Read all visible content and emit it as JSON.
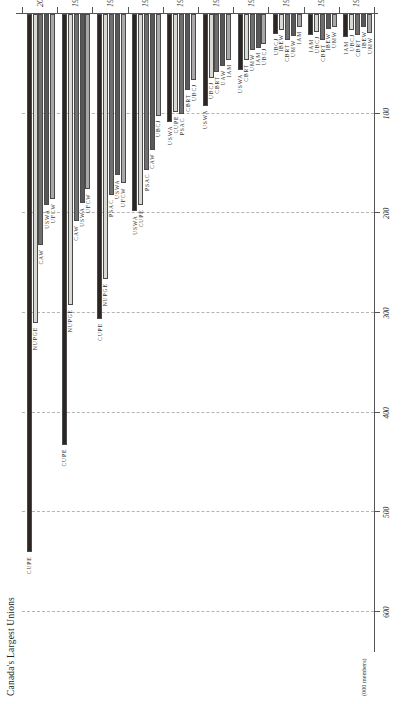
{
  "figure": {
    "title": "Canada's Largest Unions",
    "axis_unit": "(000 members)"
  },
  "chart_data": {
    "type": "bar",
    "orientation": "horizontal",
    "title": "Canada's Largest Unions",
    "xlabel": "(000 members)",
    "ylabel": "",
    "xlim": [
      0,
      640
    ],
    "grid": true,
    "legend": "none",
    "value_ticks": [
      "600",
      "500",
      "400",
      "300",
      "200",
      "100"
    ],
    "value_tick_values": [
      600,
      500,
      400,
      300,
      200,
      100
    ],
    "categories": [
      "1917",
      "1927",
      "1937",
      "1947",
      "1957",
      "1967",
      "1977",
      "1987",
      "1997",
      "2007"
    ],
    "groups": [
      {
        "year": "2007",
        "bars": [
          {
            "label": "CUPE",
            "value": 540,
            "color": "#2b2523"
          },
          {
            "label": "NUPGE",
            "value": 310,
            "color": "#d9d9d4"
          },
          {
            "label": "CAW",
            "value": 232,
            "color": "#6f6f6f"
          },
          {
            "label": "USWA",
            "value": 192,
            "color": "#585858"
          },
          {
            "label": "UFCW",
            "value": 186,
            "color": "#a8a8a8"
          }
        ]
      },
      {
        "year": "1997",
        "bars": [
          {
            "label": "CUPE",
            "value": 432,
            "color": "#2b2523"
          },
          {
            "label": "NUPGE",
            "value": 292,
            "color": "#d9d9d4"
          },
          {
            "label": "CAW",
            "value": 208,
            "color": "#6f6f6f"
          },
          {
            "label": "USWA",
            "value": 190,
            "color": "#585858"
          },
          {
            "label": "UFCW",
            "value": 176,
            "color": "#a8a8a8"
          }
        ]
      },
      {
        "year": "1987",
        "bars": [
          {
            "label": "CUPE",
            "value": 306,
            "color": "#2b2523"
          },
          {
            "label": "NUPGE",
            "value": 266,
            "color": "#d9d9d4"
          },
          {
            "label": "PSAC",
            "value": 182,
            "color": "#6f6f6f"
          },
          {
            "label": "USWA",
            "value": 162,
            "color": "#585858"
          },
          {
            "label": "UFCW",
            "value": 170,
            "color": "#a8a8a8"
          }
        ]
      },
      {
        "year": "1977",
        "bars": [
          {
            "label": "USWA",
            "value": 198,
            "color": "#2b2523"
          },
          {
            "label": "CUPE",
            "value": 192,
            "color": "#d9d9d4"
          },
          {
            "label": "PSAC",
            "value": 156,
            "color": "#6f6f6f"
          },
          {
            "label": "CAW",
            "value": 136,
            "color": "#585858"
          },
          {
            "label": "UBCJ",
            "value": 102,
            "color": "#a8a8a8"
          }
        ]
      },
      {
        "year": "1967",
        "bars": [
          {
            "label": "USWA",
            "value": 108,
            "color": "#2b2523"
          },
          {
            "label": "CUPE",
            "value": 98,
            "color": "#d9d9d4"
          },
          {
            "label": "PSAC",
            "value": 100,
            "color": "#6f6f6f"
          },
          {
            "label": "CBRT",
            "value": 76,
            "color": "#585858"
          },
          {
            "label": "UBCJ",
            "value": 66,
            "color": "#a8a8a8"
          }
        ]
      },
      {
        "year": "1957",
        "bars": [
          {
            "label": "USWA",
            "value": 92,
            "color": "#2b2523"
          },
          {
            "label": "UBCJ",
            "value": 64,
            "color": "#d9d9d4"
          },
          {
            "label": "CBRT",
            "value": 58,
            "color": "#6f6f6f"
          },
          {
            "label": "UAW",
            "value": 52,
            "color": "#585858"
          },
          {
            "label": "IAM",
            "value": 46,
            "color": "#a8a8a8"
          }
        ]
      },
      {
        "year": "1947",
        "bars": [
          {
            "label": "USWA",
            "value": 56,
            "color": "#2b2523"
          },
          {
            "label": "CBRT",
            "value": 46,
            "color": "#d9d9d4"
          },
          {
            "label": "UMW",
            "value": 36,
            "color": "#6f6f6f"
          },
          {
            "label": "IAM",
            "value": 34,
            "color": "#585858"
          },
          {
            "label": "UBCJ",
            "value": 30,
            "color": "#a8a8a8"
          }
        ]
      },
      {
        "year": "1937",
        "bars": [
          {
            "label": "UBCJ",
            "value": 20,
            "color": "#2b2523"
          },
          {
            "label": "IBEW",
            "value": 16,
            "color": "#d9d9d4"
          },
          {
            "label": "CBRT",
            "value": 26,
            "color": "#6f6f6f"
          },
          {
            "label": "UMW",
            "value": 22,
            "color": "#585858"
          },
          {
            "label": "IAM",
            "value": 13,
            "color": "#a8a8a8"
          }
        ]
      },
      {
        "year": "1927",
        "bars": [
          {
            "label": "IAM",
            "value": 21,
            "color": "#2b2523"
          },
          {
            "label": "UBCJ",
            "value": 18,
            "color": "#d9d9d4"
          },
          {
            "label": "CBRT",
            "value": 26,
            "color": "#6f6f6f"
          },
          {
            "label": "IBEW",
            "value": 15,
            "color": "#585858"
          },
          {
            "label": "UMW",
            "value": 13,
            "color": "#a8a8a8"
          }
        ]
      },
      {
        "year": "1917",
        "bars": [
          {
            "label": "IAM",
            "value": 23,
            "color": "#2b2523"
          },
          {
            "label": "UBCJ",
            "value": 16,
            "color": "#d9d9d4"
          },
          {
            "label": "CBRT",
            "value": 21,
            "color": "#6f6f6f"
          },
          {
            "label": "IBEW",
            "value": 13,
            "color": "#585858"
          },
          {
            "label": "UMW",
            "value": 19,
            "color": "#a8a8a8"
          }
        ]
      }
    ]
  }
}
